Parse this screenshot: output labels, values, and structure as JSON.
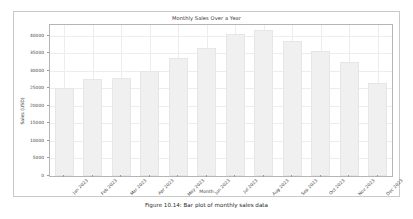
{
  "caption": "Figure 10.14: Bar plot of monthly sales data",
  "chart_data": {
    "type": "bar",
    "title": "Monthly Sales Over a Year",
    "xlabel": "Month",
    "ylabel": "Sales (USD)",
    "categories": [
      "Jan 2023",
      "Feb 2023",
      "Mar 2023",
      "Apr 2023",
      "May 2023",
      "Jun 2023",
      "Jul 2023",
      "Aug 2023",
      "Sep 2023",
      "Oct 2023",
      "Nov 2023",
      "Dec 2023"
    ],
    "values": [
      25000,
      27500,
      27800,
      29800,
      33500,
      36500,
      40500,
      41500,
      38500,
      35500,
      32500,
      26500
    ],
    "ylim": [
      0,
      43000
    ],
    "yticks": [
      0,
      5000,
      10000,
      15000,
      20000,
      25000,
      30000,
      35000,
      40000
    ],
    "ytick_labels": [
      "0",
      "5000",
      "10000",
      "15000",
      "20000",
      "25000",
      "30000",
      "35000",
      "40000"
    ],
    "grid": true,
    "legend": null,
    "bar_color": "#f0f0f0",
    "grid_color": "#ededed",
    "xtick_rotation": -45
  }
}
